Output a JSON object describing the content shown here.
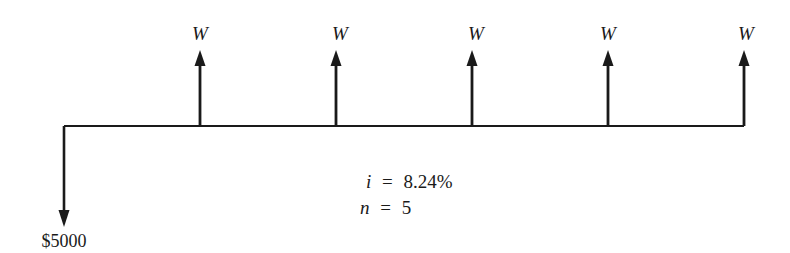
{
  "diagram": {
    "type": "cash-flow-diagram",
    "timeline": {
      "x_start": 64,
      "x_end": 744,
      "y": 126
    },
    "outflow": {
      "period": 0,
      "amount_label": "$5000",
      "direction": "down"
    },
    "inflows": [
      {
        "period": 1,
        "label": "W",
        "direction": "up"
      },
      {
        "period": 2,
        "label": "W",
        "direction": "up"
      },
      {
        "period": 3,
        "label": "W",
        "direction": "up"
      },
      {
        "period": 4,
        "label": "W",
        "direction": "up"
      },
      {
        "period": 5,
        "label": "W",
        "direction": "up"
      }
    ],
    "parameters": {
      "interest_var": "i",
      "interest_value": "8.24%",
      "periods_var": "n",
      "periods_value": "5",
      "equals": "="
    },
    "colors": {
      "ink": "#1a1a1a",
      "background": "#ffffff"
    }
  }
}
